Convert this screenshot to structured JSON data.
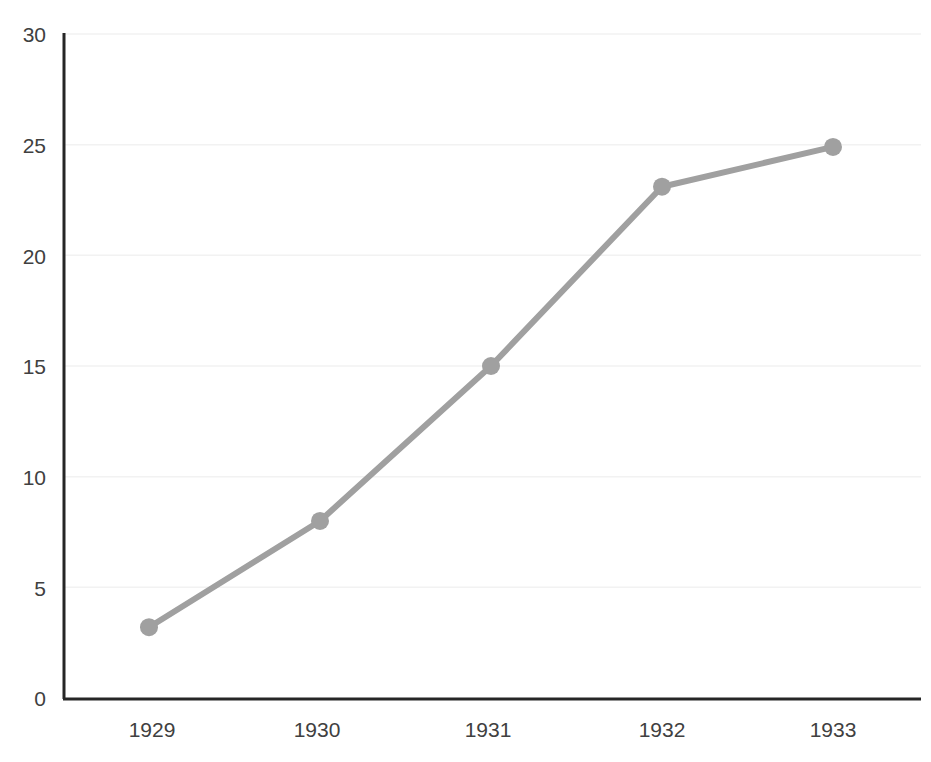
{
  "chart_data": {
    "type": "line",
    "title": "",
    "subtitle": "",
    "xlabel": "",
    "ylabel": "",
    "categories": [
      "1929",
      "1930",
      "1931",
      "1932",
      "1933"
    ],
    "values": [
      3.2,
      8.0,
      15.0,
      23.1,
      24.9
    ],
    "series": [
      {
        "name": "",
        "values": [
          3.2,
          8.0,
          15.0,
          23.1,
          24.9
        ],
        "color": "#a0a0a0",
        "marker": "circle"
      }
    ],
    "ylim": [
      0,
      30
    ],
    "ytick_labels": [
      "0",
      "5",
      "10",
      "15",
      "20",
      "25",
      "30"
    ],
    "ytick_values": [
      0,
      5,
      10,
      15,
      20,
      25,
      30
    ],
    "xtick_labels": [
      "1929",
      "1930",
      "1931",
      "1932",
      "1933"
    ],
    "grid": true,
    "grid_color": "#f2f2f2",
    "legend": "none",
    "axis_color": "#262626",
    "label_color": "#404040",
    "background": "#ffffff"
  },
  "accessibility": {
    "plot_area_name": "line-plot-area"
  }
}
